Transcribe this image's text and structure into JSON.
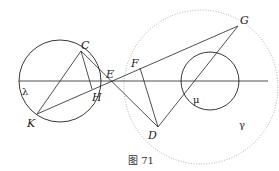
{
  "figure": {
    "caption": "图 71",
    "points": {
      "C": {
        "label": "C",
        "x": 81,
        "y": 51
      },
      "H": {
        "label": "H",
        "x": 92,
        "y": 89
      },
      "K": {
        "label": "K",
        "x": 37,
        "y": 114
      },
      "E": {
        "label": "E",
        "x": 112,
        "y": 81
      },
      "F": {
        "label": "F",
        "x": 140,
        "y": 68
      },
      "G": {
        "label": "G",
        "x": 238,
        "y": 26
      },
      "D": {
        "label": "D",
        "x": 158,
        "y": 127
      }
    },
    "circles": {
      "lambda": {
        "label": "λ",
        "cx": 60,
        "cy": 81,
        "r": 41,
        "style": "solid"
      },
      "mu": {
        "label": "μ",
        "cx": 210,
        "cy": 81,
        "r": 29,
        "style": "solid"
      },
      "gamma": {
        "label": "γ",
        "cx": 201,
        "cy": 87,
        "r": 77,
        "style": "dotted"
      }
    },
    "colors": {
      "stroke": "#222222",
      "dotted": "#888888",
      "background": "#ffffff"
    }
  }
}
